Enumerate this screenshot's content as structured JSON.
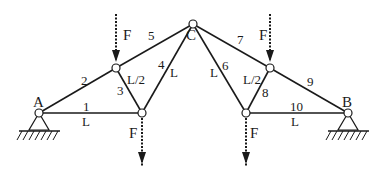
{
  "diagram": {
    "type": "truss",
    "nodes": {
      "A": {
        "label": "A",
        "x": 39,
        "y": 113
      },
      "B": {
        "label": "B",
        "x": 348,
        "y": 113
      },
      "C": {
        "label": "C",
        "x": 193,
        "y": 24
      },
      "UL": {
        "x": 116,
        "y": 68
      },
      "LL": {
        "x": 142,
        "y": 113
      },
      "UR": {
        "x": 270,
        "y": 68
      },
      "LR": {
        "x": 246,
        "y": 113
      }
    },
    "members": [
      {
        "id": "1",
        "label": "1",
        "from": "A",
        "to": "LL",
        "length_label": "L"
      },
      {
        "id": "2",
        "label": "2",
        "from": "A",
        "to": "UL"
      },
      {
        "id": "3",
        "label": "3",
        "from": "UL",
        "to": "LL",
        "length_label": "L/2"
      },
      {
        "id": "4",
        "label": "4",
        "from": "LL",
        "to": "C",
        "length_label": "L"
      },
      {
        "id": "5",
        "label": "5",
        "from": "UL",
        "to": "C"
      },
      {
        "id": "6",
        "label": "6",
        "from": "C",
        "to": "LR",
        "length_label": "L"
      },
      {
        "id": "7",
        "label": "7",
        "from": "C",
        "to": "UR"
      },
      {
        "id": "8",
        "label": "8",
        "from": "LR",
        "to": "UR",
        "length_label": "L/2"
      },
      {
        "id": "9",
        "label": "9",
        "from": "UR",
        "to": "B"
      },
      {
        "id": "10",
        "label": "10",
        "from": "LR",
        "to": "B",
        "length_label": "L"
      }
    ],
    "loads": [
      {
        "label": "F",
        "at": "UL",
        "direction": "down"
      },
      {
        "label": "F",
        "at": "LL",
        "direction": "down"
      },
      {
        "label": "F",
        "at": "UR",
        "direction": "down"
      },
      {
        "label": "F",
        "at": "LR",
        "direction": "down"
      }
    ],
    "supports": [
      {
        "at": "A",
        "type": "pin"
      },
      {
        "at": "B",
        "type": "pin"
      }
    ],
    "text": {
      "A": "A",
      "B": "B",
      "C": "C",
      "F": "F",
      "L": "L",
      "L2": "L/2",
      "m1": "1",
      "m2": "2",
      "m3": "3",
      "m4": "4",
      "m5": "5",
      "m6": "6",
      "m7": "7",
      "m8": "8",
      "m9": "9",
      "m10": "10"
    }
  }
}
